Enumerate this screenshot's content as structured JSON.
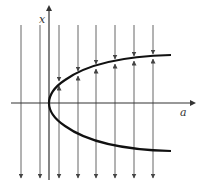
{
  "diagram": {
    "type": "bifurcation-diagram",
    "axes": {
      "horizontal_label": "a",
      "vertical_label": "x"
    },
    "curve": {
      "shape": "parabola opening right",
      "vertex": "origin",
      "upper_branch": "stable (arrows converge)",
      "lower_branch": "unstable (arrows diverge)"
    },
    "flow_lines": {
      "count_left_of_axis": 2,
      "count_right_of_axis": 6,
      "direction_far_field": "downward"
    },
    "colors": {
      "axis": "#333333",
      "curve": "#111111",
      "flow_lines": "#555555",
      "background": "#ffffff"
    }
  }
}
